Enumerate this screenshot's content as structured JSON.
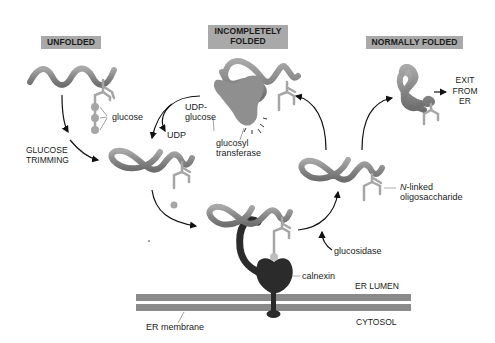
{
  "stages": {
    "unfolded": "UNFOLDED",
    "incompletely_folded_line1": "INCOMPLETELY",
    "incompletely_folded_line2": "FOLDED",
    "normally_folded": "NORMALLY FOLDED"
  },
  "labels": {
    "glucose": "glucose",
    "udp_glucose_line1": "UDP-",
    "udp_glucose_line2": "glucose",
    "udp": "UDP",
    "glucose_trimming_line1": "GLUCOSE",
    "glucose_trimming_line2": "TRIMMING",
    "glucosyl_transferase_line1": "glucosyl",
    "glucosyl_transferase_line2": "transferase",
    "exit_line1": "EXIT",
    "exit_line2": "FROM",
    "exit_line3": "ER",
    "n_linked_prefix": "N",
    "n_linked_suffix": "-linked",
    "oligosaccharide": "oligosaccharide",
    "glucosidase": "glucosidase",
    "calnexin": "calnexin",
    "er_lumen": "ER LUMEN",
    "cytosol": "CYTOSOL",
    "er_membrane": "ER membrane"
  },
  "colors": {
    "label_box": "#a9a9a9",
    "protein_chain": "#8c8c8c",
    "oligosaccharide": "#a6a6a6",
    "enzyme": "#8f8f8f",
    "calnexin": "#2b2b2b",
    "membrane": "#8a8a8a"
  }
}
